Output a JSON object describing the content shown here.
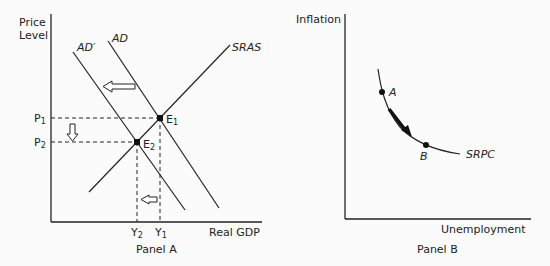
{
  "panel_a": {
    "title": "Panel A",
    "y_axis_label_line1": "Price",
    "y_axis_label_line2": "Level",
    "x_axis_label": "Real GDP",
    "curves": {
      "ad": "AD",
      "ad_prime": "AD′",
      "sras": "SRAS"
    },
    "points": {
      "e1": "E",
      "e1_sub": "1",
      "e2": "E",
      "e2_sub": "2"
    },
    "price_levels": {
      "p1": "P",
      "p1_sub": "1",
      "p2": "P",
      "p2_sub": "2"
    },
    "outputs": {
      "y1": "Y",
      "y1_sub": "1",
      "y2": "Y",
      "y2_sub": "2"
    },
    "arrows": [
      "ad-shift-left",
      "price-decrease-down",
      "output-decrease-left"
    ]
  },
  "panel_b": {
    "title": "Panel B",
    "y_axis_label": "Inflation",
    "x_axis_label": "Unemployment",
    "curve_label": "SRPC",
    "points": {
      "a": "A",
      "b": "B"
    },
    "arrows": [
      "movement-a-to-b"
    ]
  },
  "colors": {
    "ink": "#222222",
    "background": "#fbfbfb"
  }
}
